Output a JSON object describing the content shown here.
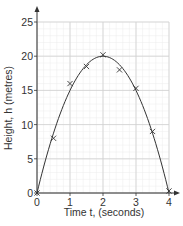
{
  "chart_data": {
    "type": "scatter",
    "title": "",
    "xlabel": "Time t, (seconds)",
    "ylabel": "Height, h (metres)",
    "xlim": [
      0,
      4
    ],
    "ylim": [
      0,
      25
    ],
    "x_ticks": [
      0,
      1,
      2,
      3,
      4
    ],
    "y_ticks": [
      0,
      5,
      10,
      15,
      20,
      25
    ],
    "grid": true,
    "minor_grid": true,
    "legend": null,
    "series": [
      {
        "name": "Measured height",
        "marker": "x",
        "x": [
          0,
          0.5,
          1,
          1.5,
          2,
          2.5,
          3,
          3.5,
          4
        ],
        "y": [
          0,
          8,
          16,
          18.5,
          20.2,
          18,
          15.3,
          9,
          0.3
        ]
      },
      {
        "name": "Curve of best fit",
        "type": "line",
        "equation": "h = 20t - 5t^2",
        "x": [
          0,
          0.5,
          1,
          1.5,
          2,
          2.5,
          3,
          3.5,
          4
        ],
        "y": [
          0,
          8.75,
          15,
          18.75,
          20,
          18.75,
          15,
          8.75,
          0
        ]
      }
    ]
  },
  "colors": {
    "axis": "#333333",
    "grid_major": "#cfcfcf",
    "grid_minor": "#ececec",
    "curve": "#333333",
    "marker": "#333333"
  }
}
